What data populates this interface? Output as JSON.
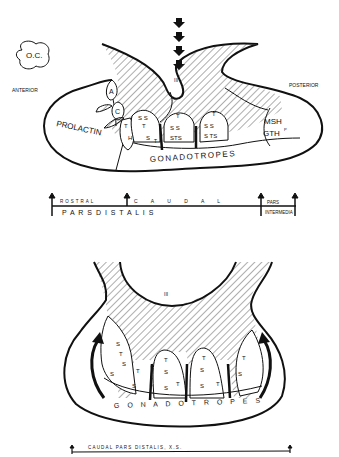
{
  "top_diagram": {
    "oc_label": "O.C.",
    "anterior": "ANTERIOR",
    "posterior": "POSTERIOR",
    "third_ventricle_mark": "III",
    "cell_labels": {
      "a": "A",
      "c": "C",
      "prolactin": "PROLACTIN",
      "msh": "MSH",
      "gth": "GTH",
      "gth_sup": "P",
      "gonadotropes": "GONADOTROPES"
    },
    "lobe_letters": {
      "lobe1": [
        "T",
        "H"
      ],
      "lobe2": [
        "S S",
        "T",
        "S",
        "T"
      ],
      "lobe3": [
        "T",
        "S  S",
        "STS"
      ],
      "lobe4": [
        "T",
        "S  S",
        "S  TS"
      ]
    }
  },
  "scale_bar": {
    "rostral": "ROSTRAL",
    "caudal": "C A U D A L",
    "pars_distalis": "P A R S    D I S T A L I S",
    "pars": "PARS",
    "intermedia": "INTERMEDIA"
  },
  "bottom_diagram": {
    "third_ventricle_mark": "III",
    "gonadotropes": "G O N A D O T R O P E S",
    "left_lobe": [
      "S",
      "T",
      "S",
      "S",
      "T",
      "S"
    ],
    "mid1": [
      "T",
      "S",
      "S",
      "T"
    ],
    "mid2": [
      "T",
      "S",
      "S",
      "T"
    ],
    "right_lobe": [
      "T",
      "S"
    ],
    "caption": "CAUDAL  PARS  DISTALIS,  X.S."
  },
  "colors": {
    "ink": "#111111",
    "background": "#ffffff"
  }
}
